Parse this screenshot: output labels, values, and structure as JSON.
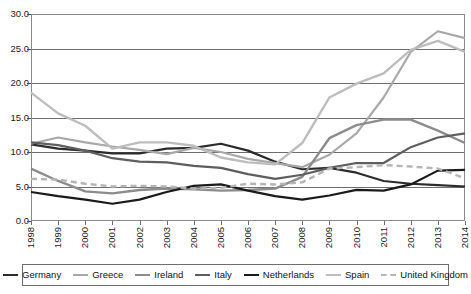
{
  "chart_data": {
    "type": "line",
    "title": "",
    "xlabel": "",
    "ylabel": "",
    "x": [
      1998,
      1999,
      2000,
      2001,
      2002,
      2003,
      2004,
      2005,
      2006,
      2007,
      2008,
      2009,
      2010,
      2011,
      2012,
      2013,
      2014
    ],
    "categories": [
      "1998",
      "1999",
      "2000",
      "2001",
      "2002",
      "2003",
      "2004",
      "2005",
      "2006",
      "2007",
      "2008",
      "2009",
      "2010",
      "2011",
      "2012",
      "2013",
      "2014"
    ],
    "ylim": [
      0.0,
      30.0
    ],
    "xlim": [
      1998,
      2014
    ],
    "yticks": [
      "0.0",
      "5.0",
      "10.0",
      "15.0",
      "20.0",
      "25.0",
      "30.0"
    ],
    "ytick_values": [
      0.0,
      5.0,
      10.0,
      15.0,
      20.0,
      25.0,
      30.0
    ],
    "grid": "horizontal",
    "legend_position": "bottom",
    "series": [
      {
        "name": "Germany",
        "color": "#2b2b2b",
        "dash": "solid",
        "width": 2.2,
        "values": [
          11.1,
          10.5,
          10.2,
          9.8,
          9.8,
          10.5,
          10.6,
          11.2,
          10.2,
          8.6,
          7.5,
          7.7,
          7.0,
          5.8,
          5.4,
          5.2,
          5.0
        ]
      },
      {
        "name": "Greece",
        "color": "#a8a8a8",
        "dash": "solid",
        "width": 2.2,
        "values": [
          11.2,
          12.1,
          11.4,
          10.8,
          10.3,
          9.7,
          10.6,
          10.0,
          9.0,
          8.4,
          7.8,
          9.6,
          12.7,
          17.9,
          24.5,
          27.5,
          26.5
        ]
      },
      {
        "name": "Ireland",
        "color": "#8c8c8c",
        "dash": "solid",
        "width": 2.4,
        "values": [
          7.6,
          5.8,
          4.3,
          4.0,
          4.5,
          4.7,
          4.6,
          4.4,
          4.5,
          4.7,
          6.4,
          12.0,
          13.9,
          14.7,
          14.7,
          13.1,
          11.3
        ]
      },
      {
        "name": "Italy",
        "color": "#5e5e5e",
        "dash": "solid",
        "width": 2.2,
        "values": [
          11.4,
          11.0,
          10.2,
          9.1,
          8.6,
          8.5,
          8.0,
          7.7,
          6.8,
          6.1,
          6.7,
          7.7,
          8.4,
          8.4,
          10.7,
          12.1,
          12.7
        ]
      },
      {
        "name": "Netherlands",
        "color": "#1a1a1a",
        "dash": "solid",
        "width": 2.2,
        "values": [
          4.2,
          3.6,
          3.1,
          2.5,
          3.1,
          4.2,
          5.1,
          5.3,
          4.4,
          3.6,
          3.1,
          3.7,
          4.5,
          4.4,
          5.3,
          7.3,
          7.4
        ]
      },
      {
        "name": "Spain",
        "color": "#bdbdbd",
        "dash": "solid",
        "width": 2.4,
        "values": [
          18.6,
          15.6,
          13.8,
          10.5,
          11.4,
          11.4,
          10.9,
          9.2,
          8.5,
          8.2,
          11.3,
          17.9,
          19.9,
          21.4,
          24.8,
          26.1,
          24.5
        ]
      },
      {
        "name": "United Kingdom",
        "color": "#b5b5b5",
        "dash": "dashed",
        "width": 2.4,
        "values": [
          6.1,
          6.0,
          5.4,
          5.0,
          5.1,
          5.0,
          4.7,
          4.8,
          5.4,
          5.3,
          5.6,
          7.6,
          7.8,
          8.1,
          7.9,
          7.6,
          6.2
        ]
      }
    ]
  },
  "legend": {
    "items": [
      {
        "label": "Germany"
      },
      {
        "label": "Greece"
      },
      {
        "label": "Ireland"
      },
      {
        "label": "Italy"
      },
      {
        "label": "Netherlands"
      },
      {
        "label": "Spain"
      },
      {
        "label": "United Kingdom"
      }
    ]
  },
  "top_strip": {
    "text": ""
  }
}
